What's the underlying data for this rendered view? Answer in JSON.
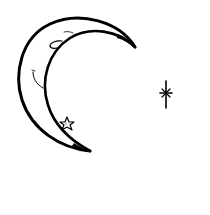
{
  "illustration": {
    "subject": "crescent moon with face, star and sparkle",
    "colors": {
      "background": "#ffffff",
      "ink": "#000000"
    },
    "elements": [
      {
        "name": "crescent-moon",
        "icon": "crescent-moon-icon"
      },
      {
        "name": "moon-eye",
        "icon": "closed-eye-icon"
      },
      {
        "name": "moon-eyebrow",
        "icon": "eyebrow-icon"
      },
      {
        "name": "moon-smile",
        "icon": "smile-icon"
      },
      {
        "name": "small-star",
        "icon": "star-icon"
      },
      {
        "name": "sparkle",
        "icon": "sparkle-icon"
      }
    ]
  }
}
